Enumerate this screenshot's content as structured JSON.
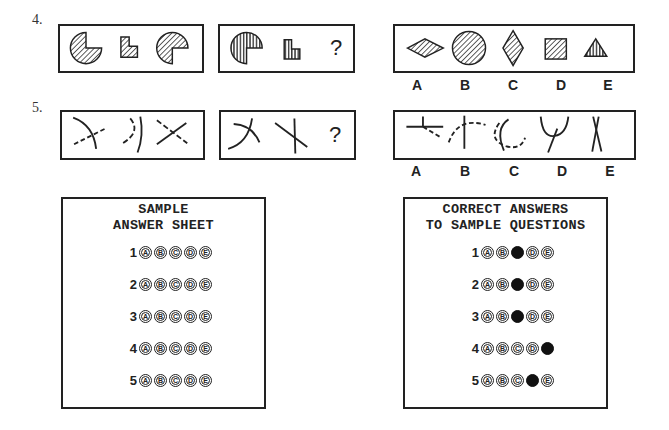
{
  "questions": [
    {
      "number": "4.",
      "problem_figures": [
        "pie-three-quarter-diagonal-hatch",
        "l-shape-diagonal-hatch",
        "pie-three-quarter-rotated-diagonal-hatch"
      ],
      "analogy_figures": [
        "pie-three-quarter-vertical-hatch",
        "l-shape-vertical-hatch"
      ],
      "missing_symbol": "?",
      "options": [
        {
          "letter": "A",
          "figure": "horizontal-diamond-diagonal-hatch"
        },
        {
          "letter": "B",
          "figure": "circle-diagonal-hatch"
        },
        {
          "letter": "C",
          "figure": "vertical-diamond-diagonal-hatch"
        },
        {
          "letter": "D",
          "figure": "square-diagonal-hatch"
        },
        {
          "letter": "E",
          "figure": "triangle-vertical-hatch"
        }
      ]
    },
    {
      "number": "5.",
      "problem_figures": [
        "arc-with-dashed-line",
        "arc-with-dashed-arc",
        "crossed-lines-dashed"
      ],
      "analogy_figures": [
        "arc-with-solid-line",
        "crossed-solid-lines"
      ],
      "missing_symbol": "?",
      "options": [
        {
          "letter": "A",
          "figure": "line-cross-with-dashed-diagonal"
        },
        {
          "letter": "B",
          "figure": "vertical-line-with-dashed-arc"
        },
        {
          "letter": "C",
          "figure": "arc-with-dashed-circle"
        },
        {
          "letter": "D",
          "figure": "arc-with-stem"
        },
        {
          "letter": "E",
          "figure": "crossed-lines-x"
        }
      ]
    }
  ],
  "sample_sheet": {
    "title_line1": "SAMPLE",
    "title_line2": "ANSWER SHEET",
    "rows": [
      {
        "num": "1",
        "bubbles": [
          "A",
          "B",
          "C",
          "D",
          "E"
        ],
        "filled": null
      },
      {
        "num": "2",
        "bubbles": [
          "A",
          "B",
          "C",
          "D",
          "E"
        ],
        "filled": null
      },
      {
        "num": "3",
        "bubbles": [
          "A",
          "B",
          "C",
          "D",
          "E"
        ],
        "filled": null
      },
      {
        "num": "4",
        "bubbles": [
          "A",
          "B",
          "C",
          "D",
          "E"
        ],
        "filled": null
      },
      {
        "num": "5",
        "bubbles": [
          "A",
          "B",
          "C",
          "D",
          "E"
        ],
        "filled": null
      }
    ]
  },
  "correct_sheet": {
    "title_line1": "CORRECT ANSWERS",
    "title_line2": "TO SAMPLE QUESTIONS",
    "rows": [
      {
        "num": "1",
        "bubbles": [
          "A",
          "B",
          "C",
          "D",
          "E"
        ],
        "filled": "C"
      },
      {
        "num": "2",
        "bubbles": [
          "A",
          "B",
          "C",
          "D",
          "E"
        ],
        "filled": "C"
      },
      {
        "num": "3",
        "bubbles": [
          "A",
          "B",
          "C",
          "D",
          "E"
        ],
        "filled": "C"
      },
      {
        "num": "4",
        "bubbles": [
          "A",
          "B",
          "C",
          "D",
          "E"
        ],
        "filled": "E"
      },
      {
        "num": "5",
        "bubbles": [
          "A",
          "B",
          "C",
          "D",
          "E"
        ],
        "filled": "D"
      }
    ]
  },
  "colors": {
    "ink": "#222222",
    "paper": "#ffffff"
  }
}
